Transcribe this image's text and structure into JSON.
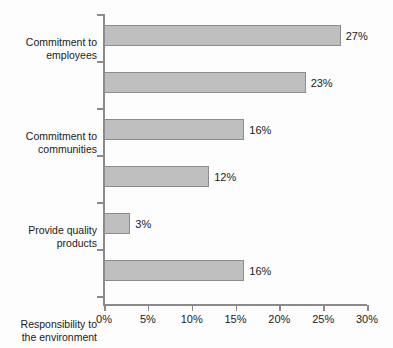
{
  "chart_data": {
    "type": "bar",
    "orientation": "horizontal",
    "title": "",
    "xlabel": "",
    "ylabel": "",
    "xlim": [
      0,
      30
    ],
    "grid": false,
    "legend": null,
    "categories": [
      "Commitment to employees",
      "Commitment to communities",
      "Provide quality products",
      "Responsibility to the environment",
      "Make charitable donations",
      "Don’t know"
    ],
    "values": [
      27,
      23,
      16,
      12,
      3,
      16
    ],
    "value_labels": [
      "27%",
      "23%",
      "16%",
      "12%",
      "3%",
      "16%"
    ],
    "xticks": [
      0,
      5,
      10,
      15,
      20,
      25,
      30
    ],
    "xtick_labels": [
      "0%",
      "5%",
      "10%",
      "15%",
      "20%",
      "25%",
      "30%"
    ],
    "bars": [
      {
        "label_line1": "Commitment to",
        "label_line2": "employees",
        "value": 27,
        "value_label": "27%"
      },
      {
        "label_line1": "Commitment to",
        "label_line2": "communities",
        "value": 23,
        "value_label": "23%"
      },
      {
        "label_line1": "Provide quality",
        "label_line2": "products",
        "value": 16,
        "value_label": "16%"
      },
      {
        "label_line1": "Responsibility to",
        "label_line2": "the environment",
        "value": 12,
        "value_label": "12%"
      },
      {
        "label_line1": "Make charitable",
        "label_line2": "donations",
        "value": 3,
        "value_label": "3%"
      },
      {
        "label_line1": "Don’t know",
        "label_line2": "",
        "value": 16,
        "value_label": "16%"
      }
    ]
  },
  "style": {
    "bar_fill": "#bfbfbf",
    "bar_border": "#8c8c8c",
    "axis_color": "#8a8a8a",
    "text_color": "#1a1a1a",
    "background": "#fdfdfd"
  }
}
